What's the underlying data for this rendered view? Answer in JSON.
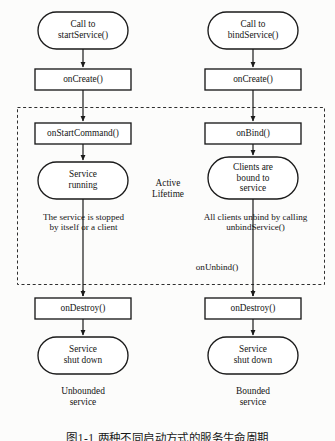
{
  "figure": {
    "caption": "图1-1 两种不同启动方式的服务生命周期",
    "background_color": "#fcfcfb",
    "line_color": "#1a1a1a"
  },
  "center": {
    "active_lifetime_label": "Active\nLifetime"
  },
  "dashed_region": {
    "name": "active-lifetime-region",
    "x": 17,
    "y": 107,
    "width": 308,
    "height": 178,
    "stroke": "#2a2a2a"
  },
  "columns": [
    {
      "id": "unbounded",
      "caption": "Unbounded\nservice",
      "nodes": [
        {
          "id": "call-start-service",
          "shape": "stadium",
          "label": "Call to\nstartService()",
          "x": 38,
          "y": 12,
          "width": 90,
          "height": 37
        },
        {
          "id": "on-create",
          "shape": "rect",
          "label": "onCreate()",
          "x": 35,
          "y": 69,
          "width": 96,
          "height": 21
        },
        {
          "id": "on-start-command",
          "shape": "rect",
          "label": "onStartCommand()",
          "x": 35,
          "y": 123,
          "width": 96,
          "height": 21
        },
        {
          "id": "service-running",
          "shape": "stadium",
          "label": "Service\nrunning",
          "x": 38,
          "y": 162,
          "width": 90,
          "height": 37
        },
        {
          "id": "on-destroy",
          "shape": "rect",
          "label": "onDestroy()",
          "x": 35,
          "y": 298,
          "width": 96,
          "height": 21
        },
        {
          "id": "service-shut-down",
          "shape": "stadium",
          "label": "Service\nshut down",
          "x": 38,
          "y": 337,
          "width": 90,
          "height": 37
        }
      ],
      "edge_labels": [
        {
          "id": "service-stopped-label",
          "label": "The service is stopped\nby itself or a client",
          "x": 16,
          "y": 212,
          "width": 135
        }
      ]
    },
    {
      "id": "bounded",
      "caption": "Bounded\nservice",
      "nodes": [
        {
          "id": "call-bind-service",
          "shape": "stadium",
          "label": "Call to\nbindService()",
          "x": 208,
          "y": 12,
          "width": 90,
          "height": 37
        },
        {
          "id": "on-create",
          "shape": "rect",
          "label": "onCreate()",
          "x": 205,
          "y": 69,
          "width": 96,
          "height": 21
        },
        {
          "id": "on-bind",
          "shape": "rect",
          "label": "onBind()",
          "x": 205,
          "y": 123,
          "width": 96,
          "height": 21
        },
        {
          "id": "clients-bound",
          "shape": "stadium",
          "label": "Clients are\nbound to\nservice",
          "x": 208,
          "y": 157,
          "width": 90,
          "height": 42
        },
        {
          "id": "on-destroy",
          "shape": "rect",
          "label": "onDestroy()",
          "x": 205,
          "y": 298,
          "width": 96,
          "height": 21
        },
        {
          "id": "service-shut-down",
          "shape": "stadium",
          "label": "Service\nshut down",
          "x": 208,
          "y": 337,
          "width": 90,
          "height": 37
        }
      ],
      "edge_labels": [
        {
          "id": "clients-unbind-label",
          "label": "All clients unbind by calling\nunbindService()",
          "x": 183,
          "y": 212,
          "width": 145
        },
        {
          "id": "on-unbind-label",
          "label": "onUnbind()",
          "x": 214,
          "y": 262,
          "width": 62
        }
      ]
    }
  ]
}
